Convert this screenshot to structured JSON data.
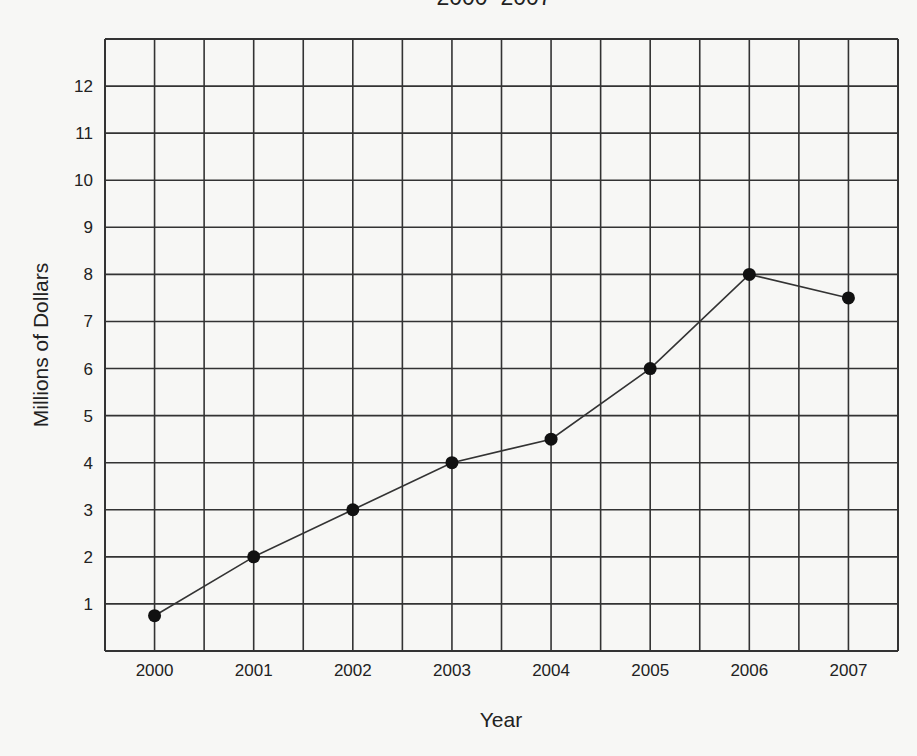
{
  "chart_data": {
    "type": "line",
    "title": "2000–2007",
    "xlabel": "Year",
    "ylabel": "Millions of Dollars",
    "categories": [
      "2000",
      "2001",
      "2002",
      "2003",
      "2004",
      "2005",
      "2006",
      "2007"
    ],
    "x": [
      2000,
      2001,
      2002,
      2003,
      2004,
      2005,
      2006,
      2007
    ],
    "values": [
      0.75,
      2,
      3,
      4,
      4.5,
      6,
      8,
      7.5
    ],
    "series": [
      {
        "name": "Millions of Dollars",
        "values": [
          0.75,
          2,
          3,
          4,
          4.5,
          6,
          8,
          7.5
        ]
      }
    ],
    "yticks": [
      1,
      2,
      3,
      4,
      5,
      6,
      7,
      8,
      9,
      10,
      11,
      12
    ],
    "ylim": [
      0,
      13
    ],
    "grid": true,
    "legend": "none",
    "markers": "filled-circle"
  },
  "colors": {
    "background": "#f7f7f5",
    "grid": "#333333",
    "line": "#333333",
    "marker": "#111111",
    "text": "#222222"
  }
}
